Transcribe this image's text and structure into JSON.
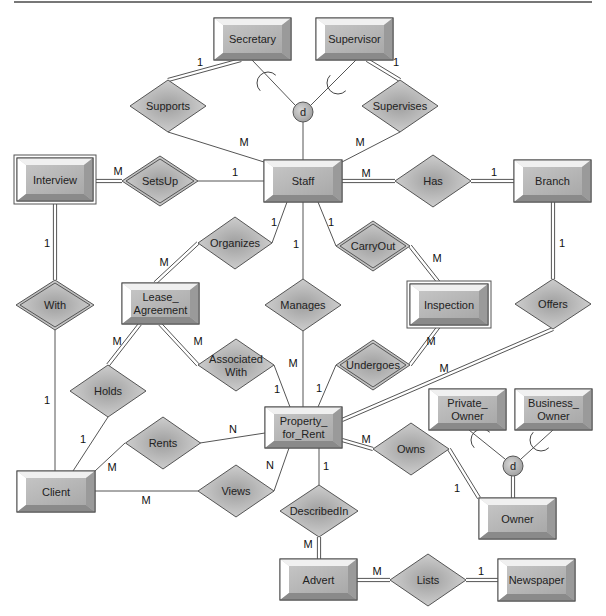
{
  "diagram": {
    "type": "ER diagram",
    "colors": {
      "entity_face": "#b9b9b9",
      "entity_light": "#f2f2f2",
      "entity_dark": "#8c8c8c",
      "rel_fill": "#bdbdbd",
      "line": "#555555",
      "text": "#222222"
    },
    "entities": [
      {
        "id": "secretary",
        "label": [
          "Secretary"
        ],
        "x": 214,
        "y": 18,
        "w": 77,
        "h": 42,
        "weak": false
      },
      {
        "id": "supervisor",
        "label": [
          "Supervisor"
        ],
        "x": 316,
        "y": 18,
        "w": 77,
        "h": 42,
        "weak": false
      },
      {
        "id": "interview",
        "label": [
          "Interview"
        ],
        "x": 17,
        "y": 158,
        "w": 76,
        "h": 43,
        "weak": true
      },
      {
        "id": "staff",
        "label": [
          "Staff"
        ],
        "x": 264,
        "y": 160,
        "w": 78,
        "h": 42,
        "weak": false
      },
      {
        "id": "branch",
        "label": [
          "Branch"
        ],
        "x": 514,
        "y": 160,
        "w": 77,
        "h": 42,
        "weak": false
      },
      {
        "id": "lease_agreement",
        "label": [
          "Lease_",
          "Agreement"
        ],
        "x": 122,
        "y": 283,
        "w": 77,
        "h": 41,
        "weak": false
      },
      {
        "id": "inspection",
        "label": [
          "Inspection"
        ],
        "x": 410,
        "y": 284,
        "w": 78,
        "h": 41,
        "weak": true
      },
      {
        "id": "property_for_rent",
        "label": [
          "Property_",
          "for_Rent"
        ],
        "x": 265,
        "y": 407,
        "w": 77,
        "h": 41,
        "weak": false
      },
      {
        "id": "private_owner",
        "label": [
          "Private_",
          "Owner"
        ],
        "x": 429,
        "y": 389,
        "w": 77,
        "h": 41,
        "weak": false
      },
      {
        "id": "business_owner",
        "label": [
          "Business_",
          "Owner"
        ],
        "x": 515,
        "y": 389,
        "w": 77,
        "h": 41,
        "weak": false
      },
      {
        "id": "client",
        "label": [
          "Client"
        ],
        "x": 17,
        "y": 471,
        "w": 78,
        "h": 41,
        "weak": false
      },
      {
        "id": "owner",
        "label": [
          "Owner"
        ],
        "x": 479,
        "y": 498,
        "w": 77,
        "h": 41,
        "weak": false
      },
      {
        "id": "advert",
        "label": [
          "Advert"
        ],
        "x": 280,
        "y": 559,
        "w": 77,
        "h": 41,
        "weak": false
      },
      {
        "id": "newspaper",
        "label": [
          "Newspaper"
        ],
        "x": 498,
        "y": 559,
        "w": 77,
        "h": 42,
        "weak": false
      }
    ],
    "relationships": [
      {
        "id": "supports",
        "label": [
          "Supports"
        ],
        "cx": 168,
        "cy": 106,
        "w": 76,
        "h": 52,
        "identifying": false
      },
      {
        "id": "supervises",
        "label": [
          "Supervises"
        ],
        "cx": 400,
        "cy": 106,
        "w": 76,
        "h": 52,
        "identifying": false
      },
      {
        "id": "setsup",
        "label": [
          "SetsUp"
        ],
        "cx": 160,
        "cy": 181,
        "w": 76,
        "h": 50,
        "identifying": true
      },
      {
        "id": "has",
        "label": [
          "Has"
        ],
        "cx": 433,
        "cy": 181,
        "w": 76,
        "h": 52,
        "identifying": false
      },
      {
        "id": "organizes",
        "label": [
          "Organizes"
        ],
        "cx": 235,
        "cy": 243,
        "w": 74,
        "h": 52,
        "identifying": false
      },
      {
        "id": "carryout",
        "label": [
          "CarryOut"
        ],
        "cx": 373,
        "cy": 246,
        "w": 74,
        "h": 50,
        "identifying": true
      },
      {
        "id": "with",
        "label": [
          "With"
        ],
        "cx": 55,
        "cy": 305,
        "w": 78,
        "h": 50,
        "identifying": true
      },
      {
        "id": "manages",
        "label": [
          "Manages"
        ],
        "cx": 303,
        "cy": 305,
        "w": 76,
        "h": 52,
        "identifying": false
      },
      {
        "id": "offers",
        "label": [
          "Offers"
        ],
        "cx": 553,
        "cy": 304,
        "w": 76,
        "h": 50,
        "identifying": false
      },
      {
        "id": "associated_with",
        "label": [
          "Associated",
          "With"
        ],
        "cx": 236,
        "cy": 365,
        "w": 76,
        "h": 52,
        "identifying": false
      },
      {
        "id": "undergoes",
        "label": [
          "Undergoes"
        ],
        "cx": 373,
        "cy": 365,
        "w": 74,
        "h": 50,
        "identifying": true
      },
      {
        "id": "holds",
        "label": [
          "Holds"
        ],
        "cx": 108,
        "cy": 391,
        "w": 76,
        "h": 52,
        "identifying": false
      },
      {
        "id": "rents",
        "label": [
          "Rents"
        ],
        "cx": 163,
        "cy": 443,
        "w": 75,
        "h": 52,
        "identifying": false
      },
      {
        "id": "owns",
        "label": [
          "Owns"
        ],
        "cx": 411,
        "cy": 449,
        "w": 76,
        "h": 52,
        "identifying": false
      },
      {
        "id": "views",
        "label": [
          "Views"
        ],
        "cx": 236,
        "cy": 491,
        "w": 76,
        "h": 52,
        "identifying": false
      },
      {
        "id": "describedin",
        "label": [
          "DescribedIn"
        ],
        "cx": 319,
        "cy": 511,
        "w": 78,
        "h": 52,
        "identifying": false
      },
      {
        "id": "lists",
        "label": [
          "Lists"
        ],
        "cx": 428,
        "cy": 580,
        "w": 76,
        "h": 52,
        "identifying": false
      }
    ],
    "specializations": [
      {
        "id": "staff_disjoint",
        "label": "d",
        "cx": 303,
        "cy": 112,
        "r": 10
      },
      {
        "id": "owner_disjoint",
        "label": "d",
        "cx": 513,
        "cy": 466,
        "r": 10
      }
    ],
    "connections": [
      {
        "from": [
          241,
          60
        ],
        "to": [
          168,
          80
        ],
        "double": true,
        "card": "1",
        "cp": [
          200,
          62
        ]
      },
      {
        "from": [
          168,
          132
        ],
        "to": [
          264,
          162
        ],
        "double": false,
        "card": "M",
        "cp": [
          244,
          142
        ]
      },
      {
        "from": [
          367,
          60
        ],
        "to": [
          400,
          80
        ],
        "double": true,
        "card": "1",
        "cp": [
          396,
          62
        ]
      },
      {
        "from": [
          400,
          132
        ],
        "to": [
          342,
          162
        ],
        "double": false,
        "card": "M",
        "cp": [
          360,
          142
        ]
      },
      {
        "from": [
          252,
          60
        ],
        "to": [
          295,
          105
        ],
        "double": false,
        "card": "",
        "cp": [
          0,
          0
        ]
      },
      {
        "from": [
          356,
          60
        ],
        "to": [
          311,
          105
        ],
        "double": false,
        "card": "",
        "cp": [
          0,
          0
        ]
      },
      {
        "from": [
          303,
          122
        ],
        "to": [
          303,
          160
        ],
        "double": false,
        "card": "",
        "cp": [
          0,
          0
        ]
      },
      {
        "from": [
          93,
          181
        ],
        "to": [
          122,
          181
        ],
        "double": true,
        "card": "M",
        "cp": [
          118,
          171
        ]
      },
      {
        "from": [
          198,
          181
        ],
        "to": [
          264,
          181
        ],
        "double": false,
        "card": "1",
        "cp": [
          235,
          172
        ]
      },
      {
        "from": [
          342,
          181
        ],
        "to": [
          395,
          181
        ],
        "double": true,
        "card": "M",
        "cp": [
          366,
          173
        ]
      },
      {
        "from": [
          471,
          181
        ],
        "to": [
          514,
          181
        ],
        "double": true,
        "card": "1",
        "cp": [
          494,
          172
        ]
      },
      {
        "from": [
          55,
          201
        ],
        "to": [
          55,
          280
        ],
        "double": true,
        "card": "1",
        "cp": [
          47,
          243
        ]
      },
      {
        "from": [
          55,
          330
        ],
        "to": [
          55,
          471
        ],
        "double": false,
        "card": "1",
        "cp": [
          47,
          400
        ]
      },
      {
        "from": [
          287,
          202
        ],
        "to": [
          272,
          243
        ],
        "double": false,
        "card": "1",
        "cp": [
          274,
          222
        ]
      },
      {
        "from": [
          198,
          243
        ],
        "to": [
          155,
          283
        ],
        "double": true,
        "card": "M",
        "cp": [
          164,
          262
        ]
      },
      {
        "from": [
          303,
          202
        ],
        "to": [
          303,
          279
        ],
        "double": false,
        "card": "1",
        "cp": [
          296,
          244
        ]
      },
      {
        "from": [
          303,
          331
        ],
        "to": [
          303,
          407
        ],
        "double": false,
        "card": "M",
        "cp": [
          293,
          363
        ]
      },
      {
        "from": [
          318,
          202
        ],
        "to": [
          336,
          246
        ],
        "double": false,
        "card": "1",
        "cp": [
          331,
          222
        ]
      },
      {
        "from": [
          410,
          246
        ],
        "to": [
          440,
          284
        ],
        "double": true,
        "card": "M",
        "cp": [
          437,
          258
        ]
      },
      {
        "from": [
          553,
          202
        ],
        "to": [
          553,
          279
        ],
        "double": true,
        "card": "1",
        "cp": [
          562,
          243
        ]
      },
      {
        "from": [
          553,
          329
        ],
        "to": [
          342,
          420
        ],
        "double": true,
        "card": "M",
        "cp": [
          444,
          368
        ]
      },
      {
        "from": [
          160,
          324
        ],
        "to": [
          198,
          365
        ],
        "double": true,
        "card": "M",
        "cp": [
          198,
          341
        ]
      },
      {
        "from": [
          274,
          365
        ],
        "to": [
          290,
          407
        ],
        "double": false,
        "card": "1",
        "cp": [
          277,
          389
        ]
      },
      {
        "from": [
          440,
          325
        ],
        "to": [
          410,
          365
        ],
        "double": true,
        "card": "M",
        "cp": [
          431,
          341
        ]
      },
      {
        "from": [
          336,
          365
        ],
        "to": [
          318,
          407
        ],
        "double": false,
        "card": "1",
        "cp": [
          319,
          388
        ]
      },
      {
        "from": [
          140,
          324
        ],
        "to": [
          108,
          365
        ],
        "double": true,
        "card": "M",
        "cp": [
          117,
          341
        ]
      },
      {
        "from": [
          108,
          417
        ],
        "to": [
          73,
          471
        ],
        "double": false,
        "card": "1",
        "cp": [
          83,
          439
        ]
      },
      {
        "from": [
          125,
          443
        ],
        "to": [
          95,
          471
        ],
        "double": false,
        "card": "M",
        "cp": [
          112,
          467
        ]
      },
      {
        "from": [
          200,
          443
        ],
        "to": [
          265,
          433
        ],
        "double": false,
        "card": "N",
        "cp": [
          233,
          429
        ]
      },
      {
        "from": [
          95,
          491
        ],
        "to": [
          198,
          491
        ],
        "double": false,
        "card": "M",
        "cp": [
          146,
          500
        ]
      },
      {
        "from": [
          274,
          491
        ],
        "to": [
          289,
          448
        ],
        "double": false,
        "card": "N",
        "cp": [
          270,
          465
        ]
      },
      {
        "from": [
          319,
          448
        ],
        "to": [
          319,
          485
        ],
        "double": false,
        "card": "1",
        "cp": [
          326,
          466
        ]
      },
      {
        "from": [
          319,
          537
        ],
        "to": [
          319,
          559
        ],
        "double": true,
        "card": "M",
        "cp": [
          308,
          544
        ]
      },
      {
        "from": [
          342,
          440
        ],
        "to": [
          373,
          449
        ],
        "double": true,
        "card": "M",
        "cp": [
          366,
          439
        ]
      },
      {
        "from": [
          449,
          449
        ],
        "to": [
          479,
          498
        ],
        "double": true,
        "card": "1",
        "cp": [
          457,
          488
        ]
      },
      {
        "from": [
          469,
          430
        ],
        "to": [
          505,
          459
        ],
        "double": false,
        "card": "",
        "cp": [
          0,
          0
        ]
      },
      {
        "from": [
          553,
          430
        ],
        "to": [
          521,
          459
        ],
        "double": false,
        "card": "",
        "cp": [
          0,
          0
        ]
      },
      {
        "from": [
          513,
          476
        ],
        "to": [
          513,
          498
        ],
        "double": true,
        "card": "",
        "cp": [
          0,
          0
        ]
      },
      {
        "from": [
          357,
          580
        ],
        "to": [
          390,
          580
        ],
        "double": true,
        "card": "M",
        "cp": [
          377,
          571
        ]
      },
      {
        "from": [
          466,
          580
        ],
        "to": [
          498,
          580
        ],
        "double": true,
        "card": "1",
        "cp": [
          481,
          571
        ]
      }
    ],
    "subset_arcs": [
      {
        "cx": 268,
        "cy": 83,
        "a": 225
      },
      {
        "cx": 338,
        "cy": 83,
        "a": 315
      },
      {
        "cx": 482,
        "cy": 440,
        "a": 225
      },
      {
        "cx": 541,
        "cy": 440,
        "a": 315
      }
    ]
  }
}
